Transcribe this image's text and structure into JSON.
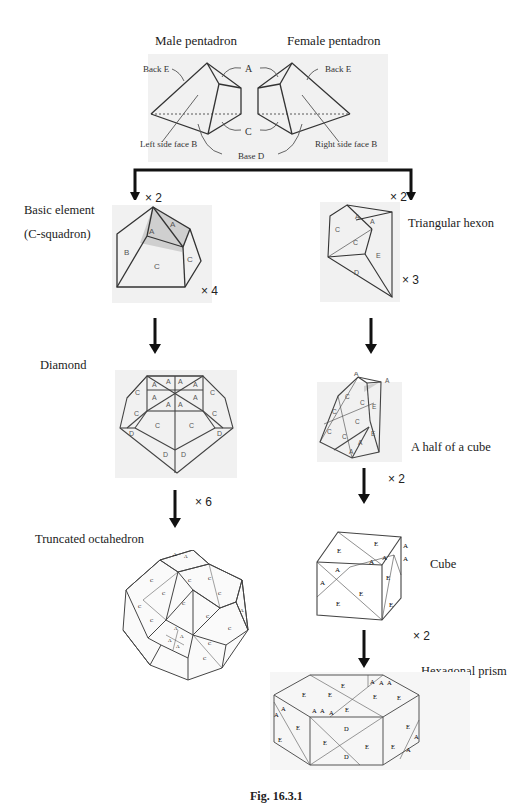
{
  "pentadrons": {
    "male_title": "Male pentadron",
    "female_title": "Female pentadron",
    "labels": {
      "back_left": "Back E",
      "back_right": "Back E",
      "a": "A",
      "c": "C",
      "left_side": "Left side face B",
      "right_side": "Right side face B",
      "base": "Base D"
    }
  },
  "left_column": {
    "branch_multiplier": "× 2",
    "basic_element": {
      "title_line1": "Basic element",
      "title_line2": "(C-squadron)",
      "faces": [
        "A",
        "A",
        "B",
        "C",
        "C"
      ],
      "multiplier": "× 4"
    },
    "diamond": {
      "title": "Diamond",
      "face_labels": [
        "A",
        "A",
        "A",
        "A",
        "A",
        "A",
        "A",
        "A",
        "C",
        "C",
        "C",
        "C",
        "C",
        "C",
        "D",
        "D",
        "D",
        "D"
      ]
    },
    "diamond_multiplier": "× 6",
    "truncated_octahedron": {
      "title": "Truncated octahedron",
      "face_labels": [
        "A",
        "C"
      ]
    }
  },
  "right_column": {
    "branch_multiplier": "× 2",
    "triangular_hexon": {
      "title": "Triangular hexon",
      "faces": [
        "A",
        "A",
        "C",
        "C",
        "E",
        "D"
      ],
      "multiplier": "× 3"
    },
    "half_cube": {
      "title": "A half of a cube",
      "faces": [
        "A",
        "A",
        "C",
        "C",
        "C",
        "C",
        "C",
        "C",
        "E",
        "E",
        "A",
        "A"
      ],
      "multiplier": "× 2"
    },
    "cube": {
      "title": "Cube",
      "faces": [
        "E",
        "E",
        "A",
        "A",
        "A",
        "A",
        "E",
        "E",
        "E",
        "E",
        "A",
        "A"
      ],
      "multiplier": "× 2"
    },
    "hexagonal_prism": {
      "title": "Hexagonal prism",
      "faces": [
        "E",
        "A",
        "A",
        "A",
        "E",
        "E",
        "E",
        "E",
        "A",
        "A",
        "A",
        "A",
        "A",
        "E",
        "E",
        "E",
        "E",
        "D",
        "E",
        "E",
        "E",
        "D",
        "A",
        "A"
      ]
    }
  },
  "caption": "Fig. 16.3.1"
}
